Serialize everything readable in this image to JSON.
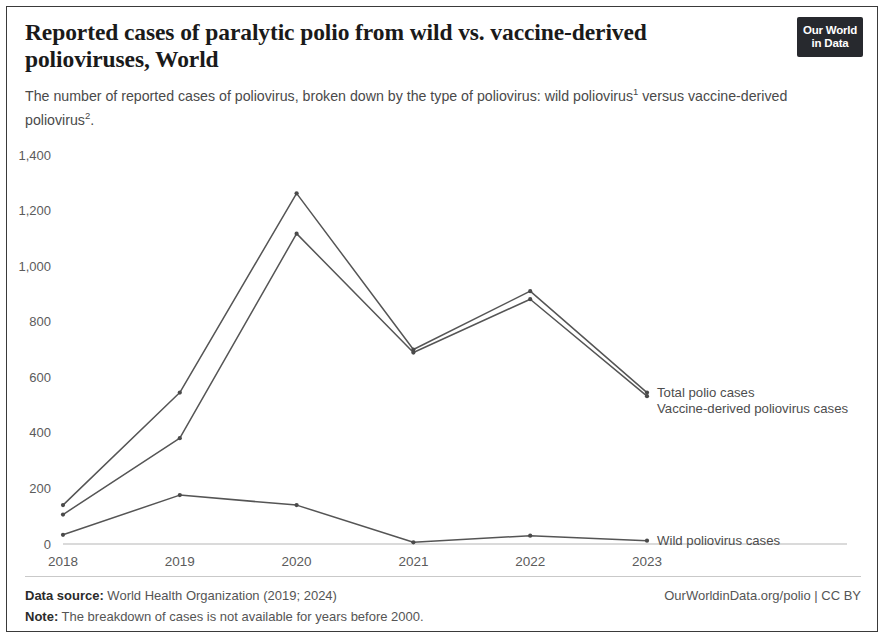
{
  "header": {
    "title": "Reported cases of paralytic polio from wild vs. vaccine-derived polioviruses, World",
    "subtitle_part1": "The number of reported cases of poliovirus, broken down by the type of poliovirus: wild poliovirus",
    "subtitle_sup1": "1",
    "subtitle_part2": " versus vaccine-derived poliovirus",
    "subtitle_sup2": "2",
    "subtitle_part3": ".",
    "logo_line1": "Our World",
    "logo_line2": "in Data"
  },
  "footer": {
    "source_label": "Data source:",
    "source_value": " World Health Organization (2019; 2024)",
    "note_label": "Note:",
    "note_value": " The breakdown of cases is not available for years before 2000.",
    "attribution": "OurWorldinData.org/polio | CC BY"
  },
  "chart_data": {
    "type": "line",
    "title": "Reported cases of paralytic polio from wild vs. vaccine-derived polioviruses, World",
    "xlabel": "",
    "ylabel": "",
    "x": [
      2018,
      2019,
      2020,
      2021,
      2022,
      2023
    ],
    "xtick_labels": [
      "2018",
      "2019",
      "2020",
      "2021",
      "2022",
      "2023"
    ],
    "ytick_labels": [
      "0",
      "200",
      "400",
      "600",
      "800",
      "1,000",
      "1,200",
      "1,400"
    ],
    "yticks": [
      0,
      200,
      400,
      600,
      800,
      1000,
      1200,
      1400
    ],
    "ylim": [
      0,
      1400
    ],
    "xlim": [
      2018,
      2023
    ],
    "grid": false,
    "legend_position": "right-inline",
    "series": [
      {
        "name": "Total polio cases",
        "values": [
          140,
          545,
          1262,
          700,
          910,
          545
        ]
      },
      {
        "name": "Vaccine-derived poliovirus cases",
        "values": [
          106,
          381,
          1117,
          689,
          881,
          532
        ]
      },
      {
        "name": "Wild poliovirus cases",
        "values": [
          33,
          176,
          140,
          6,
          30,
          12
        ]
      }
    ]
  }
}
